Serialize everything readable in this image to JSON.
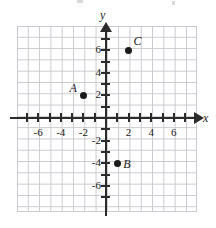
{
  "chart_data": {
    "type": "scatter",
    "title": "",
    "xlabel": "x",
    "ylabel": "y",
    "xlim": [
      -8,
      8
    ],
    "ylim": [
      -8.5,
      8
    ],
    "grid": true,
    "grid_step": 1,
    "legend": "none",
    "x_ticks": [
      -6,
      -4,
      -2,
      2,
      4,
      6
    ],
    "y_ticks": [
      6,
      4,
      2,
      -2,
      -4,
      -6
    ],
    "x_tick_labels": [
      "-6",
      "-4",
      "-2",
      "2",
      "4",
      "6"
    ],
    "y_tick_labels": [
      "6",
      "4",
      "2",
      "-2",
      "-4",
      "-6"
    ],
    "points": [
      {
        "label": "A",
        "x": -2,
        "y": 2,
        "label_side": "left"
      },
      {
        "label": "B",
        "x": 1,
        "y": -4,
        "label_side": "right"
      },
      {
        "label": "C",
        "x": 2,
        "y": 6,
        "label_side": "upper-right"
      }
    ],
    "colors": {
      "point": "#1a1a1a",
      "axis": "#2b2b2b",
      "grid": "#c9c9cf",
      "background": "#ffffff",
      "text": "#1a1a1a"
    }
  },
  "axes": {
    "x_name": "x",
    "y_name": "y"
  },
  "ticks": {
    "x": [
      {
        "label": "-6",
        "value": -6
      },
      {
        "label": "-4",
        "value": -4
      },
      {
        "label": "-2",
        "value": -2
      },
      {
        "label": "2",
        "value": 2
      },
      {
        "label": "4",
        "value": 4
      },
      {
        "label": "6",
        "value": 6
      }
    ],
    "y": [
      {
        "label": "6",
        "value": 6
      },
      {
        "label": "4",
        "value": 4
      },
      {
        "label": "2",
        "value": 2
      },
      {
        "label": "-2",
        "value": -2
      },
      {
        "label": "-4",
        "value": -4
      },
      {
        "label": "-6",
        "value": -6
      }
    ]
  },
  "points": {
    "A": {
      "label": "A",
      "x": -2,
      "y": 2
    },
    "B": {
      "label": "B",
      "x": 1,
      "y": -4
    },
    "C": {
      "label": "C",
      "x": 2,
      "y": 6
    }
  }
}
